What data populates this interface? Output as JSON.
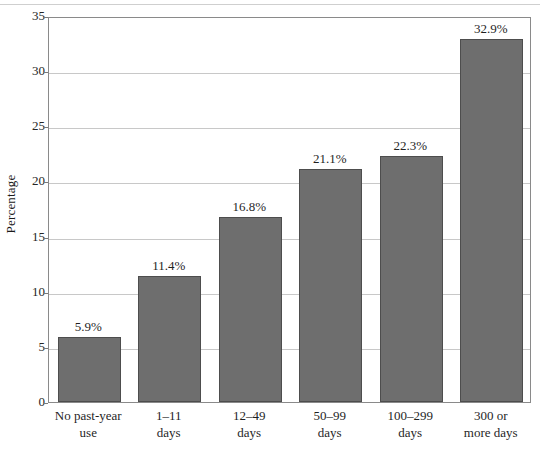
{
  "chart_data": {
    "type": "bar",
    "title": "",
    "subtitle": "",
    "xlabel": "",
    "ylabel": "Percentage",
    "ylim": [
      0,
      35
    ],
    "ytick_values": [
      0,
      5,
      10,
      15,
      20,
      25,
      30,
      35
    ],
    "ytick_labels": [
      "0",
      "5",
      "10",
      "15",
      "20",
      "25",
      "30",
      "35"
    ],
    "grid": true,
    "legend": "none",
    "bar_color": "#6e6e6e",
    "bar_edge_color": "#4d4d4d",
    "categories": [
      "No past-year use",
      "1–11 days",
      "12–49 days",
      "50–99 days",
      "100–299 days",
      "300 or more days"
    ],
    "category_lines": [
      [
        "No past-year",
        "use"
      ],
      [
        "1–11",
        "days"
      ],
      [
        "12–49",
        "days"
      ],
      [
        "50–99",
        "days"
      ],
      [
        "100–299",
        "days"
      ],
      [
        "300 or",
        "more days"
      ]
    ],
    "values": [
      5.9,
      11.4,
      16.8,
      21.1,
      22.3,
      32.9
    ],
    "data_labels": [
      "5.9%",
      "11.4%",
      "16.8%",
      "21.1%",
      "22.3%",
      "32.9%"
    ]
  }
}
